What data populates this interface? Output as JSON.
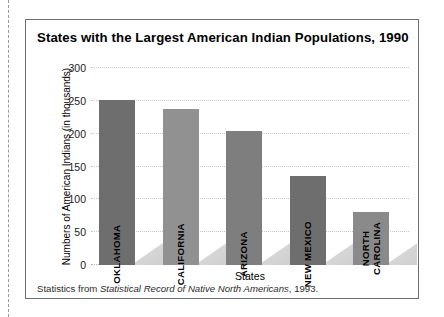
{
  "figure": {
    "title": "States with the Largest American Indian Populations, 1990",
    "footnote_prefix": "Statistics from ",
    "footnote_source": "Statistical Record of Native North Americans",
    "footnote_suffix": ", 1993."
  },
  "chart_data": {
    "type": "bar",
    "title": "States with the Largest American Indian Populations, 1990",
    "xlabel": "States",
    "ylabel": "Numbers of American Indians (in thousands)",
    "categories": [
      "OKLAHOMA",
      "CALIFORNIA",
      "ARIZONA",
      "NEW MEXICO",
      "NORTH CAROLINA"
    ],
    "category_label_lines": [
      [
        "OKLAHOMA"
      ],
      [
        "CALIFORNIA"
      ],
      [
        "ARIZONA"
      ],
      [
        "NEW MEXICO"
      ],
      [
        "NORTH",
        "CAROLINA"
      ]
    ],
    "values": [
      252,
      237,
      204,
      135,
      80
    ],
    "bar_colors": [
      "#6e6e6e",
      "#919191",
      "#7e7e7e",
      "#6e6e6e",
      "#8a8a8a"
    ],
    "ylim": [
      0,
      300
    ],
    "yticks": [
      0,
      50,
      100,
      150,
      200,
      250,
      300
    ],
    "ytick_labels": [
      "0",
      "50",
      "100",
      "150",
      "200",
      "250",
      "300"
    ],
    "grid": true,
    "grid_style": "dotted",
    "legend": "none"
  },
  "style": {
    "frame_color": "#6d6d6d",
    "grid_color": "#c9c9c9",
    "text_color": "#000000"
  }
}
